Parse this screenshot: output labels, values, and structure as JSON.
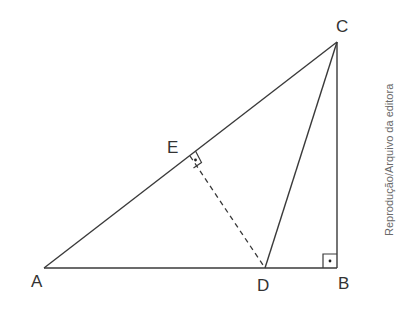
{
  "diagram": {
    "type": "geometry-triangle",
    "points": {
      "A": {
        "label": "A",
        "x": 44,
        "y": 268
      },
      "B": {
        "label": "B",
        "x": 337,
        "y": 268
      },
      "C": {
        "label": "C",
        "x": 337,
        "y": 42
      },
      "D": {
        "label": "D",
        "x": 265,
        "y": 268
      },
      "E": {
        "label": "E",
        "x": 190,
        "y": 156
      }
    },
    "segments": [
      {
        "from": "A",
        "to": "B",
        "style": "solid"
      },
      {
        "from": "B",
        "to": "C",
        "style": "solid"
      },
      {
        "from": "A",
        "to": "C",
        "style": "solid"
      },
      {
        "from": "C",
        "to": "D",
        "style": "solid"
      },
      {
        "from": "D",
        "to": "E",
        "style": "dashed"
      }
    ],
    "right_angles": [
      "B",
      "E"
    ],
    "line_color": "#3a3a3a"
  },
  "labels": {
    "A": "A",
    "B": "B",
    "C": "C",
    "D": "D",
    "E": "E"
  },
  "credit": "Reprodução/Arquivo da editora"
}
